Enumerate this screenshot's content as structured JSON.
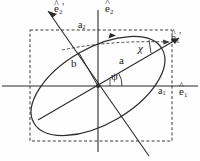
{
  "figure": {
    "background": "#fefefe",
    "stroke_color": "#2b2b2b",
    "text_color": "#1a1a1a"
  },
  "labels": {
    "e2_prime": {
      "base": "e",
      "hat": "^",
      "sub": "2",
      "prime": "'",
      "x": 56,
      "y": 3
    },
    "e2": {
      "base": "e",
      "hat": "^",
      "sub": "2",
      "prime": "",
      "x": 106,
      "y": 4
    },
    "e1_prime": {
      "base": "e",
      "hat": "^",
      "sub": "1",
      "prime": "'",
      "x": 172,
      "y": 33
    },
    "e1": {
      "base": "e",
      "hat": "^",
      "sub": "1",
      "prime": "",
      "x": 180,
      "y": 88
    },
    "a2": {
      "text": "a",
      "sub": "2",
      "x": 79,
      "y": 22
    },
    "a1": {
      "text": "a",
      "sub": "1",
      "x": 159,
      "y": 88
    },
    "a": {
      "text": "a",
      "sub": "",
      "x": 120,
      "y": 57
    },
    "b": {
      "text": "b",
      "sub": "",
      "x": 72,
      "y": 60
    },
    "chi": {
      "text": "χ",
      "x": 139,
      "y": 45
    },
    "psi": {
      "text": "ψ",
      "x": 112,
      "y": 73
    }
  },
  "geometry": {
    "origin": {
      "x": 98,
      "y": 86
    },
    "ellipse": {
      "semi_major": 74,
      "semi_minor": 38,
      "rotation_deg": -30
    },
    "bounding_box": {
      "x": 30,
      "y": 30,
      "width": 142,
      "height": 111
    },
    "axis_h": {
      "x1": 2,
      "y1": 86,
      "x2": 198,
      "y2": 86
    },
    "axis_v": {
      "x1": 98,
      "y1": 10,
      "x2": 98,
      "y2": 152
    },
    "e1_prime_axis": {
      "x1": 40,
      "y1": 119,
      "x2": 178,
      "y2": 39
    },
    "e2_prime_axis": {
      "x1": 48,
      "y1": 10,
      "x2": 148,
      "y2": 155
    },
    "chord_a": {
      "x1": 60,
      "y1": 48,
      "x2": 170,
      "y2": 41
    },
    "psi_deg": 30,
    "chi_deg": 18
  }
}
